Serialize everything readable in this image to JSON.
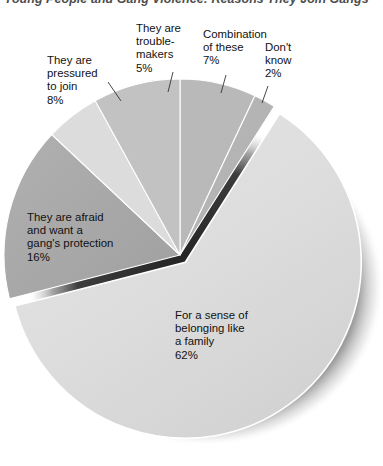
{
  "title": "Young People and Gang Violence: Reasons They Join Gangs",
  "chart_data": {
    "type": "pie",
    "title": "Young People and Gang Violence: Reasons They Join Gangs",
    "xlabel": "",
    "ylabel": "",
    "units": "percent",
    "legend": "none",
    "grid": false,
    "exploded_slice": "For a sense of belonging like a family",
    "categories": [
      "Combination of these",
      "Don't know",
      "For a sense of belonging like a family",
      "They are afraid and want a gang's protection",
      "They are trouble-makers",
      "They are pressured to join"
    ],
    "values": [
      7,
      2,
      62,
      16,
      5,
      8
    ],
    "slices": [
      {
        "label": "Combination of these",
        "label_lines": [
          "Combination",
          "of these"
        ],
        "value": 7,
        "value_text": "7%",
        "color": "#b9b9b9",
        "start_deg": 0,
        "end_deg": 25.2,
        "leader": true
      },
      {
        "label": "Don't know",
        "label_lines": [
          "Don't",
          "know"
        ],
        "value": 2,
        "value_text": "2%",
        "color": "#b4b4b4",
        "start_deg": 25.2,
        "end_deg": 32.4,
        "leader": true
      },
      {
        "label": "For a sense of belonging like a family",
        "label_lines": [
          "For a sense of",
          "belonging like",
          "a family"
        ],
        "value": 62,
        "value_text": "62%",
        "color": "#dedede",
        "start_deg": 32.4,
        "end_deg": 255.6,
        "leader": false,
        "exploded": true
      },
      {
        "label": "They are afraid and want a gang's protection",
        "label_lines": [
          "They are afraid",
          "and want a",
          "gang's protection"
        ],
        "value": 16,
        "value_text": "16%",
        "color": "#a8a8a8",
        "start_deg": 255.6,
        "end_deg": 313.2,
        "leader": false
      },
      {
        "label": "They are trouble-makers",
        "label_lines": [
          "They are",
          "trouble-",
          "makers"
        ],
        "value": 5,
        "value_text": "5%",
        "color": "#dcdcdc",
        "start_deg": 313.2,
        "end_deg": 331.2,
        "leader": true
      },
      {
        "label": "They are pressured to join",
        "label_lines": [
          "They are",
          "pressured",
          "to join"
        ],
        "value": 8,
        "value_text": "8%",
        "color": "#c2c2c2",
        "start_deg": 331.2,
        "end_deg": 360,
        "leader": true
      }
    ]
  },
  "labels": {
    "pressured": "They are\npressured\nto join\n8%",
    "trouble": "They are\ntrouble-\nmakers\n5%",
    "combination": "Combination\nof these\n7%",
    "dontknow": "Don't\nknow\n2%",
    "afraid": "They are afraid\nand want a\ngang's protection\n16%",
    "belonging": "For a sense of\nbelonging like\na family\n62%"
  },
  "colors": {
    "background": "#ffffff",
    "text": "#111111",
    "title": "#4d4d4d",
    "shadow": "#1a1a1a",
    "slice_lightest": "#dedede",
    "slice_light": "#dcdcdc",
    "slice_mid": "#c2c2c2",
    "slice_mid2": "#b9b9b9",
    "slice_dark": "#a8a8a8",
    "outline": "#ffffff"
  }
}
